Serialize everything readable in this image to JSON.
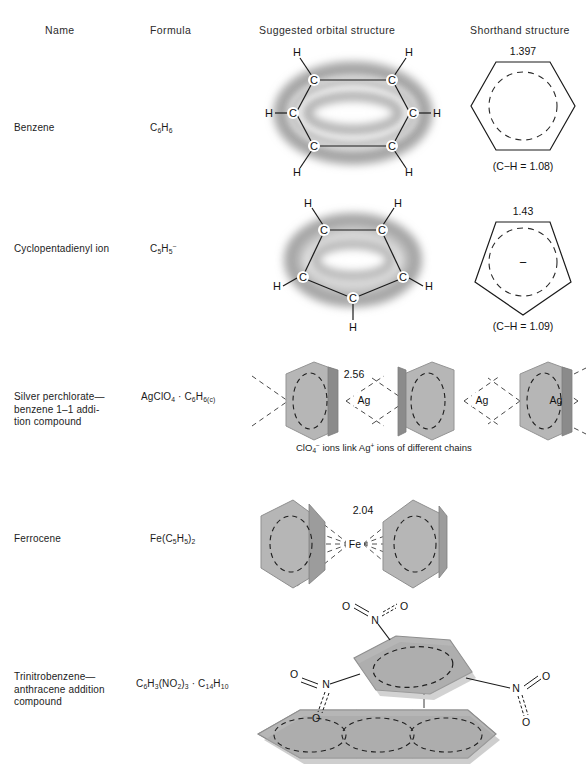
{
  "figure": {
    "kind": "chemistry-structure-table",
    "headers": [
      {
        "id": "name",
        "label": "Name"
      },
      {
        "id": "formula",
        "label": "Formula"
      },
      {
        "id": "orbital",
        "label": "Suggested orbital structure"
      },
      {
        "id": "shorthand",
        "label": "Shorthand structure"
      }
    ]
  },
  "rows": [
    {
      "id": "benzene",
      "name": "Benzene",
      "formula_html": "C<sub>6</sub>H<sub>6</sub>",
      "orbital": {
        "ring": "hexagon",
        "atom_labels": [
          "C",
          "C",
          "C",
          "C",
          "C",
          "C"
        ],
        "substituent_labels": [
          "H",
          "H",
          "H",
          "H",
          "H",
          "H"
        ],
        "pi_cloud": "doughnut above and below ring"
      },
      "shorthand": {
        "polygon": "hexagon",
        "bond_length": "1.397",
        "note": "(C−H = 1.08)",
        "inner": "dashed circle",
        "charge": ""
      }
    },
    {
      "id": "cyclopentadienyl-ion",
      "name": "Cyclopentadienyl ion",
      "formula_html": "C<sub>5</sub>H<sub>5</sub><sup>−</sup>",
      "orbital": {
        "ring": "pentagon",
        "atom_labels": [
          "C",
          "C",
          "C",
          "C",
          "C"
        ],
        "substituent_labels": [
          "H",
          "H",
          "H",
          "H",
          "H"
        ],
        "pi_cloud": "doughnut above and below ring"
      },
      "shorthand": {
        "polygon": "pentagon",
        "bond_length": "1.43",
        "note": "(C−H = 1.09)",
        "inner": "dashed circle",
        "charge": "−"
      }
    },
    {
      "id": "silver-perchlorate-benzene",
      "name": "Silver perchlorate—benzene 1–1 addition compound",
      "name_lines": [
        "Silver  perchlorate—",
        "benzene 1–1 addi-",
        "tion compound"
      ],
      "formula_html": "AgClO<sub>4</sub> · C<sub>6</sub>H<sub>6(c)</sub>",
      "orbital": {
        "chain_units": 3,
        "ring_type": "benzene disc",
        "metal_labels": [
          "Ag",
          "Ag",
          "Ag"
        ],
        "distance_label": "2.56"
      },
      "caption_html": "ClO<sub>4</sub><sup>−</sup> ions link Ag<sup>+</sup> ions of different chains"
    },
    {
      "id": "ferrocene",
      "name": "Ferrocene",
      "formula_html": "Fe(C<sub>5</sub>H<sub>5</sub>)<sub>2</sub>",
      "orbital": {
        "ring_type": "cyclopentadienyl disc",
        "metal_label": "Fe",
        "distance_label": "2.04",
        "rings": 2
      }
    },
    {
      "id": "trinitrobenzene-anthracene",
      "name": "Trinitrobenzene—anthracene addition compound",
      "name_lines": [
        "Trinitrobenzene—",
        "anthracene addition",
        "compound"
      ],
      "formula_html": "C<sub>6</sub>H<sub>3</sub>(NO<sub>2</sub>)<sub>3</sub> · C<sub>14</sub>H<sub>10</sub>",
      "orbital": {
        "top_ring": "trinitrobenzene",
        "bottom_ring": "anthracene (3 fused rings)",
        "nitro_labels": [
          {
            "n": "N",
            "o1": "O",
            "o2": "O"
          },
          {
            "n": "N",
            "o1": "O",
            "o2": "O"
          },
          {
            "n": "N",
            "o1": "O",
            "o2": "O"
          }
        ],
        "stack_axis": "dash-dot vertical line"
      }
    }
  ],
  "colors": {
    "ink": "#1a1a1a",
    "ring_fill": "#b4b4b4",
    "ring_edge": "#8d8d8d",
    "cloud": "#b9b9b9",
    "paper": "#ffffff"
  }
}
